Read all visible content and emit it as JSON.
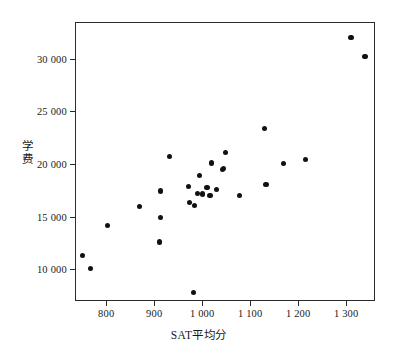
{
  "chart_data": {
    "type": "scatter",
    "title": "",
    "xlabel": "SAT平均分",
    "ylabel": "学费",
    "xlim": [
      735,
      1360
    ],
    "ylim": [
      7000,
      33500
    ],
    "grid": false,
    "legend": null,
    "xticks": [
      800,
      900,
      1000,
      1100,
      1200,
      1300
    ],
    "xticklabels": [
      "800",
      "900",
      "1 000",
      "1 100",
      "1 200",
      "1 300"
    ],
    "yticks": [
      10000,
      15000,
      20000,
      25000,
      30000
    ],
    "yticklabels": [
      "10 000",
      "15 000",
      "20 000",
      "25 000",
      "30 000"
    ],
    "marker": "filled-circle",
    "marker_color": "#111111",
    "points": [
      {
        "x": 748,
        "y": 11450
      },
      {
        "x": 765,
        "y": 10150
      },
      {
        "x": 800,
        "y": 14250
      },
      {
        "x": 868,
        "y": 16050
      },
      {
        "x": 909,
        "y": 12700
      },
      {
        "x": 911,
        "y": 15050
      },
      {
        "x": 911,
        "y": 17550
      },
      {
        "x": 930,
        "y": 20800
      },
      {
        "x": 969,
        "y": 17950
      },
      {
        "x": 972,
        "y": 16450
      },
      {
        "x": 979,
        "y": 7900
      },
      {
        "x": 982,
        "y": 16200
      },
      {
        "x": 988,
        "y": 17300
      },
      {
        "x": 992,
        "y": 19050
      },
      {
        "x": 999,
        "y": 17250
      },
      {
        "x": 1008,
        "y": 17900
      },
      {
        "x": 1014,
        "y": 17150
      },
      {
        "x": 1018,
        "y": 20200
      },
      {
        "x": 1028,
        "y": 17700
      },
      {
        "x": 1040,
        "y": 19550
      },
      {
        "x": 1043,
        "y": 19700
      },
      {
        "x": 1046,
        "y": 21200
      },
      {
        "x": 1075,
        "y": 17150
      },
      {
        "x": 1128,
        "y": 23500
      },
      {
        "x": 1131,
        "y": 18150
      },
      {
        "x": 1168,
        "y": 20150
      },
      {
        "x": 1213,
        "y": 20500
      },
      {
        "x": 1308,
        "y": 32100
      },
      {
        "x": 1337,
        "y": 30300
      }
    ]
  },
  "axis": {
    "x_tick_labels": [
      "800",
      "900",
      "1 000",
      "1 100",
      "1 200",
      "1 300"
    ],
    "y_tick_labels": [
      "10 000",
      "15 000",
      "20 000",
      "25 000",
      "30 000"
    ],
    "x_axis_title": "SAT平均分",
    "y_axis_title": "学费"
  }
}
